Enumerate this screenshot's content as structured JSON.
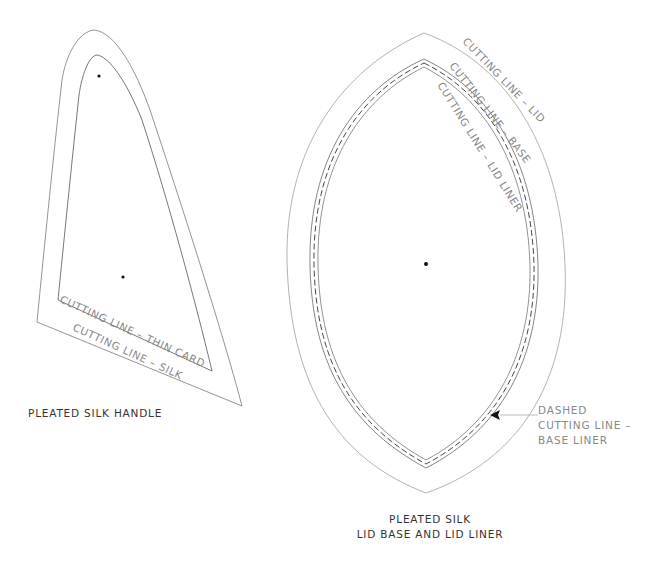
{
  "handle": {
    "caption": "PLEATED SILK HANDLE",
    "labels": {
      "thin_card": "CUTTING LINE – THIN CARD",
      "silk": "CUTTING LINE – SILK"
    }
  },
  "lid": {
    "caption_line1": "PLEATED SILK",
    "caption_line2": "LID BASE AND LID LINER",
    "labels": {
      "lid": "CUTTING LINE – LID",
      "base": "CUTTING LINE – BASE",
      "lid_liner": "CUTTING LINE – LID LINER"
    },
    "annotation": {
      "line1": "DASHED",
      "line2": "CUTTING LINE –",
      "line3": "BASE LINER"
    }
  },
  "colors": {
    "outline": "#9a9a9a",
    "dark_line": "#444444",
    "dot": "#111111"
  }
}
